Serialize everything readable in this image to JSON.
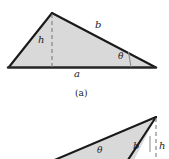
{
  "figure": {
    "background_color": "#ffffff",
    "stroke_color": "#1a1a1a",
    "fill_color": "#d9d9d9",
    "dash_color": "#808080",
    "panels": [
      {
        "id": "panel-a",
        "caption": "(a)",
        "shape": "acute-triangle",
        "labels": {
          "height": "h",
          "side_b": "b",
          "side_a": "a",
          "angle": "θ"
        }
      },
      {
        "id": "panel-b",
        "caption": "",
        "shape": "obtuse-triangle",
        "labels": {
          "height": "h",
          "side_b": "b",
          "angle": "θ"
        }
      }
    ]
  },
  "panel_a": {
    "label_h": "h",
    "label_b": "b",
    "label_a": "a",
    "label_theta": "θ",
    "caption": "(a)"
  },
  "panel_b": {
    "label_h": "h",
    "label_b": "b",
    "label_theta": "θ"
  }
}
